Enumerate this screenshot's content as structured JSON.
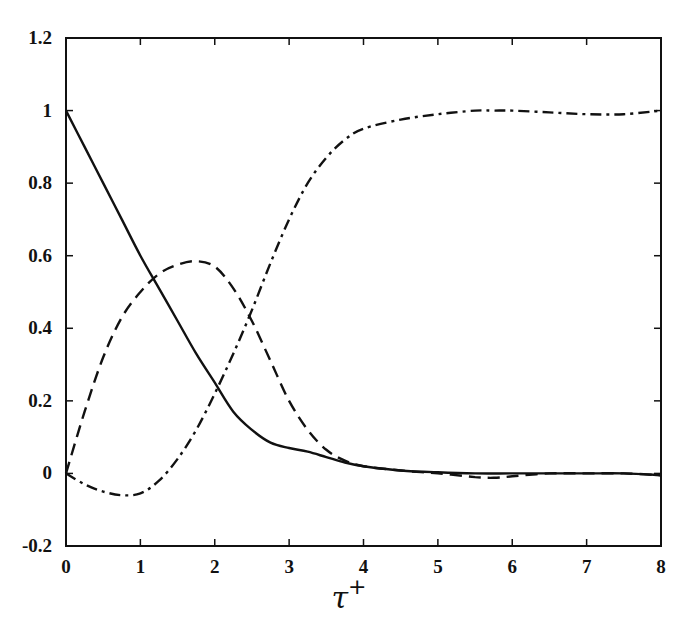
{
  "chart_data": {
    "type": "line",
    "title": "",
    "xlabel": "τ+",
    "ylabel": "",
    "xlim": [
      0,
      8
    ],
    "ylim": [
      -0.2,
      1.2
    ],
    "xticks": [
      "0",
      "1",
      "2",
      "3",
      "4",
      "5",
      "6",
      "7",
      "8"
    ],
    "yticks": [
      "-0.2",
      "0",
      "0.2",
      "0.4",
      "0.6",
      "0.8",
      "1",
      "1.2"
    ],
    "grid": false,
    "legend": null,
    "series": [
      {
        "name": "solid",
        "style": "solid",
        "x": [
          0,
          0.25,
          0.5,
          0.75,
          1.0,
          1.25,
          1.5,
          1.75,
          2.0,
          2.25,
          2.5,
          2.75,
          3.0,
          3.25,
          3.5,
          3.75,
          4.0,
          4.5,
          5.0,
          5.5,
          6.0,
          6.5,
          7.0,
          7.5,
          8.0
        ],
        "values": [
          1.0,
          0.9,
          0.8,
          0.7,
          0.6,
          0.51,
          0.42,
          0.33,
          0.25,
          0.17,
          0.12,
          0.085,
          0.07,
          0.06,
          0.045,
          0.03,
          0.02,
          0.008,
          0.003,
          0.0,
          0.0,
          0.0,
          0.0,
          0.0,
          -0.005
        ]
      },
      {
        "name": "dashed",
        "style": "dashed",
        "x": [
          0,
          0.25,
          0.5,
          0.75,
          1.0,
          1.25,
          1.5,
          1.75,
          2.0,
          2.25,
          2.5,
          2.75,
          3.0,
          3.25,
          3.5,
          3.75,
          4.0,
          4.5,
          5.0,
          5.5,
          5.75,
          6.0,
          6.5,
          7.0,
          7.5,
          8.0
        ],
        "values": [
          0.0,
          0.17,
          0.32,
          0.43,
          0.5,
          0.55,
          0.575,
          0.585,
          0.57,
          0.51,
          0.42,
          0.31,
          0.2,
          0.12,
          0.065,
          0.035,
          0.02,
          0.008,
          0.0,
          -0.01,
          -0.012,
          -0.008,
          0.0,
          0.0,
          0.0,
          -0.005
        ]
      },
      {
        "name": "dash-dot",
        "style": "dashdot",
        "x": [
          0,
          0.25,
          0.5,
          0.75,
          1.0,
          1.25,
          1.5,
          1.75,
          2.0,
          2.25,
          2.5,
          2.75,
          3.0,
          3.25,
          3.5,
          3.75,
          4.0,
          4.5,
          5.0,
          5.5,
          5.75,
          6.0,
          6.5,
          7.0,
          7.5,
          8.0
        ],
        "values": [
          0.0,
          -0.03,
          -0.05,
          -0.06,
          -0.055,
          -0.02,
          0.04,
          0.12,
          0.22,
          0.33,
          0.45,
          0.58,
          0.7,
          0.8,
          0.87,
          0.92,
          0.95,
          0.975,
          0.99,
          1.0,
          1.0,
          1.0,
          0.995,
          0.99,
          0.99,
          1.0
        ]
      }
    ]
  }
}
